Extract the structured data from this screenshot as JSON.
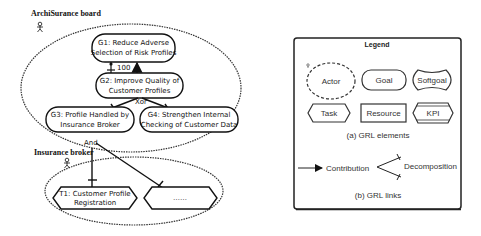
{
  "diagram": {
    "actors": [
      {
        "id": "archisurance",
        "label": "ArchiSurance board"
      },
      {
        "id": "broker",
        "label": "Insurance broker"
      }
    ],
    "goals": [
      {
        "id": "g1",
        "line1": "G1: Reduce Adverse",
        "line2": "Selection of Risk Profiles"
      },
      {
        "id": "g2",
        "line1": "G2: Improve Quality of",
        "line2": "Customer Profiles"
      },
      {
        "id": "g3",
        "line1": "G3: Profile Handled by",
        "line2": "Insurance Broker"
      },
      {
        "id": "g4",
        "line1": "G4: Strengthen Internal",
        "line2": "Checking of Customer Data"
      }
    ],
    "tasks": [
      {
        "id": "t1",
        "line1": "T1: Customer Profile",
        "line2": "Registration"
      },
      {
        "id": "t2",
        "line1": "……"
      }
    ],
    "links": {
      "contribution_value": "100",
      "xor_label": "Xor",
      "and_label": "And"
    }
  },
  "legend": {
    "title": "Legend",
    "elements": {
      "actor": "Actor",
      "goal": "Goal",
      "softgoal": "Softgoal",
      "task": "Task",
      "resource": "Resource",
      "kpi": "KPI"
    },
    "caption_a": "(a) GRL elements",
    "links": {
      "contribution": "Contribution",
      "decomposition": "Decomposition"
    },
    "caption_b": "(b) GRL links"
  }
}
